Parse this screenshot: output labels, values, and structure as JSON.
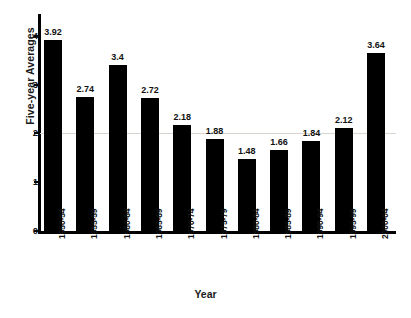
{
  "chart_data": {
    "type": "bar",
    "title": "",
    "xlabel": "Year",
    "ylabel": "Five-year Averages",
    "categories": [
      "1950-54",
      "1955-59",
      "1960-64",
      "1965-69",
      "1970-74",
      "1975-79",
      "1980-84",
      "1985-89",
      "1990-94",
      "1995-99",
      "2000-04"
    ],
    "values": [
      3.92,
      2.74,
      3.4,
      2.72,
      2.18,
      1.88,
      1.48,
      1.66,
      1.84,
      2.12,
      3.64
    ],
    "value_labels": [
      "3.92",
      "2.74",
      "3.4",
      "2.72",
      "2.18",
      "1.88",
      "1.48",
      "1.66",
      "1.84",
      "2.12",
      "3.64"
    ],
    "ylim": [
      0,
      4.45
    ],
    "y_ticks": [
      0,
      1,
      2,
      3,
      4
    ],
    "y_tick_labels": [
      "0",
      "1",
      "2",
      "3",
      "4"
    ],
    "grid": "horizontal-single-at-2",
    "gridlines": [
      2
    ],
    "legend": "none",
    "bar_color": "#000000",
    "background_color": "#ffffff",
    "axis_color": "#000000",
    "gridline_color": "#d9d4cd"
  },
  "axes": {
    "y_title": "Five-year Averages",
    "x_title": "Year"
  }
}
